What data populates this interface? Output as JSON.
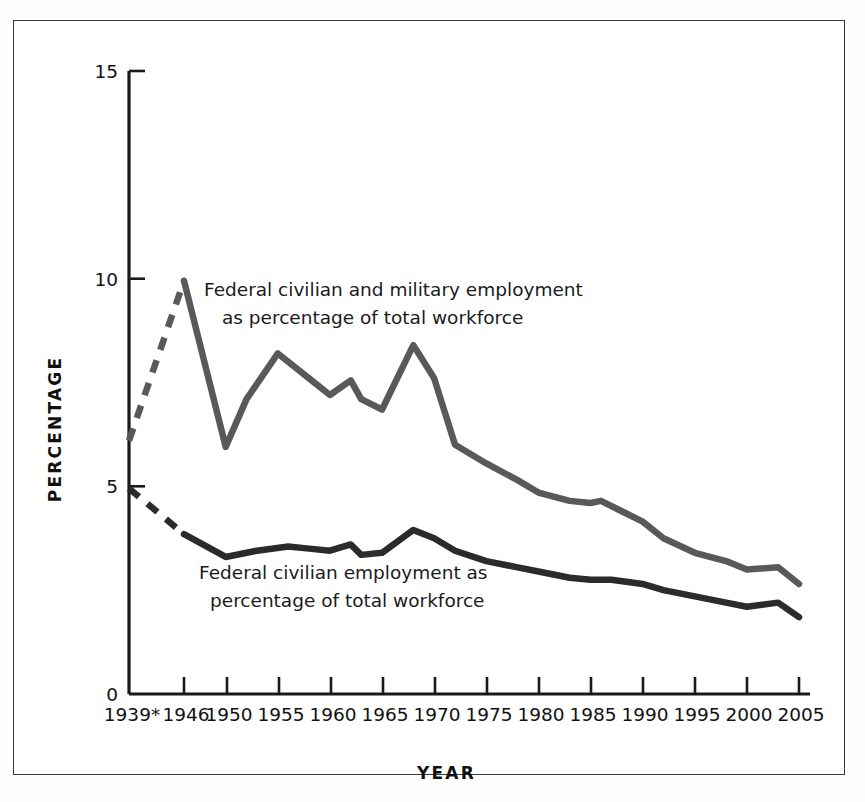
{
  "chart_data": {
    "type": "line",
    "title": "",
    "xlabel": "YEAR",
    "ylabel": "PERCENTAGE",
    "xlim": [
      1939,
      2005
    ],
    "ylim": [
      0,
      15
    ],
    "yticks": [
      "0",
      "5",
      "10",
      "15"
    ],
    "ytick_values": [
      0,
      5,
      10,
      15
    ],
    "xticks": [
      "1939*",
      "1946",
      "1950",
      "1955",
      "1960",
      "1965",
      "1970",
      "1975",
      "1980",
      "1985",
      "1990",
      "1995",
      "2000",
      "2005"
    ],
    "xtick_values": [
      1939,
      1946,
      1950,
      1955,
      1960,
      1965,
      1970,
      1975,
      1980,
      1985,
      1990,
      1995,
      2000,
      2005
    ],
    "grid": false,
    "legend_position": "inline-annotation",
    "series": [
      {
        "name": "Federal civilian and military employment as percentage of total workforce",
        "color": "#595959",
        "annotation_line_1": "Federal civilian and military employment",
        "annotation_line_2": "as percentage of total workforce",
        "dashed_from": 1939,
        "dashed_to": 1946,
        "x": [
          1939,
          1946,
          1950,
          1952,
          1955,
          1958,
          1960,
          1962,
          1963,
          1965,
          1968,
          1970,
          1972,
          1975,
          1978,
          1980,
          1983,
          1985,
          1986,
          1988,
          1990,
          1992,
          1995,
          1998,
          2000,
          2003,
          2005
        ],
        "values": [
          6.1,
          9.95,
          5.95,
          7.1,
          8.2,
          7.6,
          7.2,
          7.55,
          7.1,
          6.85,
          8.4,
          7.6,
          6.0,
          5.55,
          5.15,
          4.85,
          4.65,
          4.6,
          4.65,
          4.4,
          4.15,
          3.75,
          3.4,
          3.2,
          3.0,
          3.05,
          2.65
        ]
      },
      {
        "name": "Federal civilian employment as percentage of total workforce",
        "color": "#2b2b2b",
        "annotation_line_1": "Federal civilian employment as",
        "annotation_line_2": "percentage of total workforce",
        "dashed_from": 1939,
        "dashed_to": 1946,
        "x": [
          1939,
          1946,
          1950,
          1953,
          1956,
          1958,
          1960,
          1962,
          1963,
          1965,
          1968,
          1970,
          1972,
          1975,
          1978,
          1980,
          1983,
          1985,
          1987,
          1990,
          1992,
          1995,
          1998,
          2000,
          2003,
          2005
        ],
        "values": [
          4.95,
          3.85,
          3.3,
          3.45,
          3.55,
          3.5,
          3.45,
          3.6,
          3.35,
          3.4,
          3.95,
          3.75,
          3.45,
          3.2,
          3.05,
          2.95,
          2.8,
          2.75,
          2.75,
          2.65,
          2.5,
          2.35,
          2.2,
          2.1,
          2.2,
          1.85
        ]
      }
    ]
  },
  "figure": {
    "footnote_marker": "*"
  }
}
